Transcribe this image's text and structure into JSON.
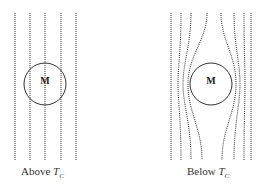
{
  "panels": [
    {
      "id": "above",
      "caption_prefix": "Above ",
      "caption_symbol": "T",
      "caption_sub": "C",
      "object_label": "M"
    },
    {
      "id": "below",
      "caption_prefix": "Below ",
      "caption_symbol": "T",
      "caption_sub": "C",
      "object_label": "M"
    }
  ],
  "colors": {
    "line": "#444444",
    "circle": "#333333",
    "text": "#333333"
  }
}
